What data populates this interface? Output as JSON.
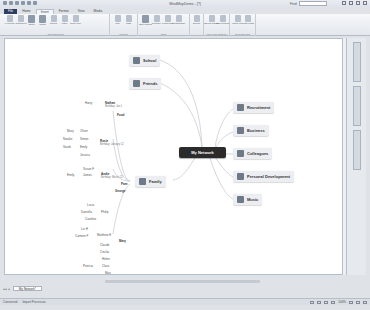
{
  "window": {
    "title": "MindMapDemo - [?]",
    "find_label": "Find",
    "find_placeholder": ""
  },
  "tabs": [
    {
      "label": "File",
      "type": "file"
    },
    {
      "label": "Home",
      "type": "normal"
    },
    {
      "label": "Insert",
      "type": "active"
    },
    {
      "label": "Format",
      "type": "normal"
    },
    {
      "label": "View",
      "type": "normal"
    },
    {
      "label": "Media",
      "type": "normal"
    }
  ],
  "ribbon": {
    "groups": [
      {
        "label": "Topic Elements",
        "buttons": [
          "Hyperlink",
          "Attachment",
          "Notes",
          "Image",
          "Callout",
          "Label",
          "Topic Icon"
        ]
      },
      {
        "label": "Markers",
        "buttons": [
          "Icon",
          "Tags"
        ]
      },
      {
        "label": "Tools",
        "buttons": [
          "Spell Check",
          "Replace",
          "Properties",
          "Relationship"
        ]
      },
      {
        "label": "",
        "buttons": [
          "Export"
        ]
      },
      {
        "label": "More Link Options",
        "buttons": [
          "Bound Range",
          "Insert Range"
        ]
      },
      {
        "label": "Scroll Bounds",
        "buttons": [
          "Insert Link",
          "Map Parts"
        ]
      }
    ]
  },
  "map": {
    "central": "My Network",
    "main_topics": [
      {
        "label": "School",
        "side": "left"
      },
      {
        "label": "Friends",
        "side": "left"
      },
      {
        "label": "Recruitment",
        "side": "right"
      },
      {
        "label": "Business",
        "side": "right"
      },
      {
        "label": "Colleagues",
        "side": "right"
      },
      {
        "label": "Personal Development",
        "side": "right"
      },
      {
        "label": "Music",
        "side": "right"
      },
      {
        "label": "Family",
        "side": "left"
      }
    ],
    "subtopics": [
      {
        "label": "Harry",
        "bold": false
      },
      {
        "label": "Nathan",
        "bold": true
      },
      {
        "label": "Birthday: Jan 1",
        "bold": false,
        "note": true
      },
      {
        "label": "Food",
        "bold": true
      },
      {
        "label": "Mary",
        "bold": false
      },
      {
        "label": "Oliver",
        "bold": false
      },
      {
        "label": "Natalie",
        "bold": false
      },
      {
        "label": "Simon",
        "bold": false
      },
      {
        "label": "Sarah",
        "bold": false
      },
      {
        "label": "Rosie",
        "bold": true
      },
      {
        "label": "Birthday: January 12",
        "bold": false,
        "note": true
      },
      {
        "label": "Emily",
        "bold": false
      },
      {
        "label": "Jessica",
        "bold": false
      },
      {
        "label": "Susan F",
        "bold": false
      },
      {
        "label": "Emily",
        "bold": false
      },
      {
        "label": "James",
        "bold": false
      },
      {
        "label": "Andie",
        "bold": true
      },
      {
        "label": "Birthday: March 12",
        "bold": false,
        "note": true
      },
      {
        "label": "Pam",
        "bold": true
      },
      {
        "label": "George",
        "bold": true
      },
      {
        "label": "Lucia",
        "bold": false
      },
      {
        "label": "Daniella",
        "bold": false
      },
      {
        "label": "Philip",
        "bold": false
      },
      {
        "label": "Caroline",
        "bold": false
      },
      {
        "label": "Liz H",
        "bold": false
      },
      {
        "label": "Carmen F",
        "bold": false
      },
      {
        "label": "Matthew E",
        "bold": false
      },
      {
        "label": "Mary",
        "bold": true
      },
      {
        "label": "Claude",
        "bold": false
      },
      {
        "label": "Cecilia",
        "bold": false
      },
      {
        "label": "Helen",
        "bold": false
      },
      {
        "label": "Patricia",
        "bold": false
      },
      {
        "label": "Clara",
        "bold": false
      },
      {
        "label": "Max",
        "bold": false
      }
    ]
  },
  "doc_tabs": [
    {
      "label": "My Network*"
    }
  ],
  "statusbar": {
    "left_items": [
      "Connected",
      "Import Processes"
    ],
    "zoom": "100%"
  }
}
